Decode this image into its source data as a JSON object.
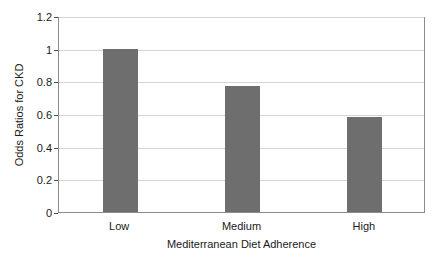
{
  "chart_data": {
    "type": "bar",
    "title": "",
    "subtitle": "",
    "xlabel": "Mediterranean Diet Adherence",
    "ylabel": "Odds Ratios for CKD",
    "categories": [
      "Low",
      "Medium",
      "High"
    ],
    "values": [
      1.0,
      0.77,
      0.58
    ],
    "ylim": [
      0,
      1.2
    ],
    "y_ticks": [
      0,
      0.2,
      0.4,
      0.6,
      0.8,
      1,
      1.2
    ],
    "y_tick_labels": [
      "0",
      "0.2",
      "0.4",
      "0.6",
      "0.8",
      "1",
      "1.2"
    ],
    "grid": true,
    "grid_axis": "y",
    "legend": false,
    "legend_position": "none",
    "bar_color": "#6e6e6e",
    "plot_background": "#ffffff",
    "gridline_color": "#d4d4d4",
    "axis_color": "#8c8c8c",
    "text_color": "#1a1a1a"
  }
}
